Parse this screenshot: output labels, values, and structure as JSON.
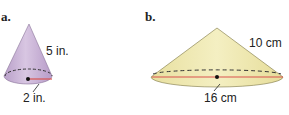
{
  "figures": [
    {
      "label": "a.",
      "shape": "cone",
      "slant_height": "5 in.",
      "radius": "2 in.",
      "fill_color": "#c9b3d6",
      "radius_line_color": "#d9534f"
    },
    {
      "label": "b.",
      "shape": "cone",
      "slant_height": "10 cm",
      "diameter": "16 cm",
      "fill_color": "#efe9b0",
      "diameter_line_color": "#d9534f"
    }
  ]
}
